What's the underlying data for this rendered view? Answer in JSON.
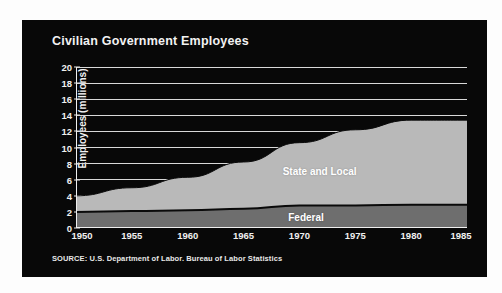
{
  "panel": {
    "background_color": "#080808",
    "title": "Civilian Government Employees",
    "source_note": "SOURCE: U.S. Department of Labor. Bureau of Labor Statistics"
  },
  "chart_data": {
    "type": "area",
    "stacked": true,
    "title": "Civilian Government Employees",
    "xlabel": "",
    "ylabel": "Employees (millions)",
    "xlim": [
      1950,
      1985
    ],
    "ylim": [
      0,
      20
    ],
    "grid": true,
    "legend_position": "inline-labels",
    "x_tick_labels": [
      "1950",
      "1955",
      "1960",
      "1965",
      "1970",
      "1975",
      "1980",
      "1985"
    ],
    "y_tick_labels": [
      "0",
      "2",
      "4",
      "6",
      "8",
      "10",
      "12",
      "14",
      "16",
      "18",
      "20"
    ],
    "x": [
      1950,
      1955,
      1960,
      1965,
      1970,
      1975,
      1980,
      1985
    ],
    "series": [
      {
        "name": "Federal",
        "fill_color": "#6e6e6e",
        "label": "Federal",
        "values": [
          2.0,
          2.1,
          2.2,
          2.4,
          2.8,
          2.8,
          2.9,
          2.9
        ]
      },
      {
        "name": "State and Local",
        "fill_color": "#b9b9b9",
        "label": "State and Local",
        "values": [
          2.0,
          2.9,
          4.1,
          5.8,
          7.8,
          9.4,
          10.5,
          10.5
        ]
      }
    ],
    "totals": [
      4.0,
      5.0,
      6.3,
      8.2,
      10.6,
      12.2,
      13.4,
      13.4
    ],
    "annotations": [
      {
        "text": "State and Local",
        "color": "#ffffff"
      },
      {
        "text": "Federal",
        "color": "#ffffff"
      }
    ],
    "colors": {
      "background": "#080808",
      "gridline": "#d8d8d8",
      "text": "#f0f0f0",
      "federal": "#6e6e6e",
      "state_local": "#b9b9b9",
      "boundary": "#0a0a0a"
    }
  }
}
